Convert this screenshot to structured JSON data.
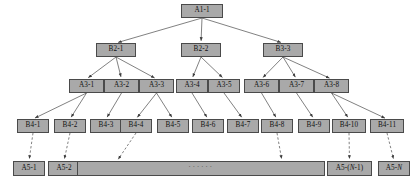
{
  "diagram": {
    "width": 418,
    "height": 186,
    "node_fill": "#a9a9a9",
    "node_border": "#4a4a4a",
    "edge_color": "#4a4a4a",
    "background": "#ffffff"
  },
  "levels": [
    {
      "id": "level-1",
      "nodes": [
        {
          "id": "A1-1",
          "label": "A1-1",
          "x": 181,
          "y": 4,
          "w": 42,
          "h": 14
        }
      ]
    },
    {
      "id": "level-2",
      "nodes": [
        {
          "id": "B2-1",
          "label": "B2-1",
          "x": 96,
          "y": 43,
          "w": 40,
          "h": 14
        },
        {
          "id": "B2-2",
          "label": "B2-2",
          "x": 181,
          "y": 43,
          "w": 40,
          "h": 14
        },
        {
          "id": "B3-3",
          "label": "B3-3",
          "x": 263,
          "y": 43,
          "w": 40,
          "h": 14
        }
      ]
    },
    {
      "id": "level-3",
      "nodes": [
        {
          "id": "A3-1",
          "label": "A3-1",
          "x": 69,
          "y": 79,
          "w": 35,
          "h": 14
        },
        {
          "id": "A3-2",
          "label": "A3-2",
          "x": 104,
          "y": 79,
          "w": 35,
          "h": 14
        },
        {
          "id": "A3-3",
          "label": "A3-3",
          "x": 139,
          "y": 79,
          "w": 35,
          "h": 14
        },
        {
          "id": "A3-4",
          "label": "A3-4",
          "x": 176,
          "y": 79,
          "w": 32,
          "h": 14
        },
        {
          "id": "A3-5",
          "label": "A3-5",
          "x": 208,
          "y": 79,
          "w": 32,
          "h": 14
        },
        {
          "id": "A3-6",
          "label": "A3-6",
          "x": 244,
          "y": 79,
          "w": 35,
          "h": 14
        },
        {
          "id": "A3-7",
          "label": "A3-7",
          "x": 279,
          "y": 79,
          "w": 35,
          "h": 14
        },
        {
          "id": "A3-8",
          "label": "A3-8",
          "x": 314,
          "y": 79,
          "w": 35,
          "h": 14
        }
      ]
    },
    {
      "id": "level-4",
      "nodes": [
        {
          "id": "B4-1",
          "label": "B4-1",
          "x": 17,
          "y": 119,
          "w": 32,
          "h": 14
        },
        {
          "id": "B4-2",
          "label": "B4-2",
          "x": 54,
          "y": 119,
          "w": 32,
          "h": 14
        },
        {
          "id": "B4-3",
          "label": "B4-3",
          "x": 90,
          "y": 119,
          "w": 32,
          "h": 14
        },
        {
          "id": "B4-4",
          "label": "B4-4",
          "x": 120,
          "y": 119,
          "w": 32,
          "h": 14
        },
        {
          "id": "B4-5",
          "label": "B4-5",
          "x": 157,
          "y": 119,
          "w": 32,
          "h": 14
        },
        {
          "id": "B4-6",
          "label": "B4-6",
          "x": 192,
          "y": 119,
          "w": 32,
          "h": 14
        },
        {
          "id": "B4-7",
          "label": "B4-7",
          "x": 227,
          "y": 119,
          "w": 32,
          "h": 14
        },
        {
          "id": "B4-8",
          "label": "B4-8",
          "x": 261,
          "y": 119,
          "w": 32,
          "h": 14
        },
        {
          "id": "B4-9",
          "label": "B4-9",
          "x": 298,
          "y": 119,
          "w": 32,
          "h": 14
        },
        {
          "id": "B4-10",
          "label": "B4-10",
          "x": 332,
          "y": 119,
          "w": 34,
          "h": 14
        },
        {
          "id": "B4-11",
          "label": "B4-11",
          "x": 370,
          "y": 119,
          "w": 34,
          "h": 14
        }
      ]
    },
    {
      "id": "level-5",
      "nodes": [
        {
          "id": "A5-1",
          "label": "A5-1",
          "x": 13,
          "y": 161,
          "w": 32,
          "h": 15
        },
        {
          "id": "A5-2",
          "label": "A5-2",
          "x": 48,
          "y": 161,
          "w": 32,
          "h": 15
        },
        {
          "id": "A5-mid",
          "label": "······",
          "x": 77,
          "y": 161,
          "w": 248,
          "h": 15,
          "ellipsis": true
        },
        {
          "id": "A5-N-1",
          "label": "A5-(N-1)",
          "label_parts": [
            "A5-(",
            "N",
            "-1)"
          ],
          "x": 327,
          "y": 161,
          "w": 45,
          "h": 15
        },
        {
          "id": "A5-N",
          "label": "A5-N",
          "label_parts": [
            "A5-",
            "N",
            ""
          ],
          "x": 378,
          "y": 161,
          "w": 32,
          "h": 15
        }
      ]
    }
  ],
  "edges": {
    "solid": [
      {
        "from": "A1-1",
        "to": "B2-1"
      },
      {
        "from": "A1-1",
        "to": "B2-2"
      },
      {
        "from": "A1-1",
        "to": "B3-3"
      },
      {
        "from": "B2-1",
        "to": "A3-1"
      },
      {
        "from": "B2-1",
        "to": "A3-2"
      },
      {
        "from": "B2-1",
        "to": "A3-3"
      },
      {
        "from": "B2-2",
        "to": "A3-4"
      },
      {
        "from": "B2-2",
        "to": "A3-5"
      },
      {
        "from": "B3-3",
        "to": "A3-6"
      },
      {
        "from": "B3-3",
        "to": "A3-7"
      },
      {
        "from": "B3-3",
        "to": "A3-8"
      },
      {
        "from": "A3-1",
        "to": "B4-1"
      },
      {
        "from": "A3-1",
        "to": "B4-2"
      },
      {
        "from": "A3-2",
        "to": "B4-3"
      },
      {
        "from": "A3-3",
        "to": "B4-4"
      },
      {
        "from": "A3-3",
        "to": "B4-5"
      },
      {
        "from": "A3-4",
        "to": "B4-6"
      },
      {
        "from": "A3-5",
        "to": "B4-7"
      },
      {
        "from": "A3-6",
        "to": "B4-8"
      },
      {
        "from": "A3-7",
        "to": "B4-9"
      },
      {
        "from": "A3-8",
        "to": "B4-10"
      },
      {
        "from": "A3-8",
        "to": "B4-11"
      }
    ],
    "dashed": [
      {
        "from": "B4-1",
        "to": "A5-1"
      },
      {
        "from": "B4-2",
        "to": "A5-2"
      },
      {
        "from": "B4-4",
        "to": "A5-mid-left"
      },
      {
        "from": "B4-8",
        "to": "A5-mid-right"
      },
      {
        "from": "B4-10",
        "to": "A5-N-1"
      },
      {
        "from": "B4-11",
        "to": "A5-N"
      }
    ]
  }
}
